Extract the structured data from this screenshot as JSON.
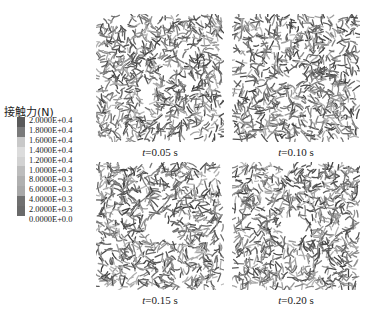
{
  "legend": {
    "title": "接触力(N)",
    "ticks": [
      "2.0000E+0.4",
      "1.8000E+0.4",
      "1.6000E+0.4",
      "1.4000E+0.4",
      "1.2000E+0.4",
      "1.0000E+0.4",
      "8.0000E+0.3",
      "6.0000E+0.3",
      "4.0000E+0.3",
      "2.0000E+0.3",
      "0.0000E+0.0"
    ],
    "band_colors": [
      "#5a5a5a",
      "#7a7a7a",
      "#c8c8c8",
      "#dcdcdc",
      "#d2d2d2",
      "#bdbdbd",
      "#b0b0b0",
      "#a8a8a8",
      "#707070",
      "#6a6a6a"
    ]
  },
  "panels": [
    {
      "t_var": "t",
      "t_value": "=0.05 s",
      "hole_radius": 0
    },
    {
      "t_var": "t",
      "t_value": "=0.10 s",
      "hole_radius": 7
    },
    {
      "t_var": "t",
      "t_value": "=0.15 s",
      "hole_radius": 11
    },
    {
      "t_var": "t",
      "t_value": "=0.20 s",
      "hole_radius": 12
    }
  ]
}
